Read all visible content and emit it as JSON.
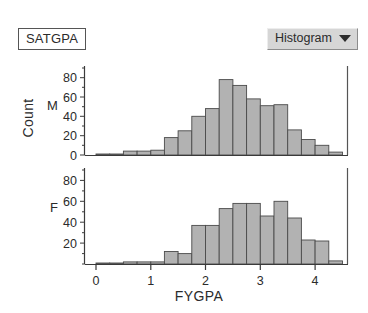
{
  "header": {
    "variable_label": "SATGPA",
    "menu_label": "Histogram",
    "menu_icon": "chevron-down-icon"
  },
  "axes": {
    "y_title": "Count",
    "x_title": "FYGPA",
    "x_ticks": [
      "0",
      "1",
      "2",
      "3",
      "4"
    ],
    "y_ticks_top": [
      "0",
      "20",
      "40",
      "60",
      "80"
    ],
    "y_ticks_bottom": [
      "20",
      "40",
      "60",
      "80"
    ],
    "group_top": "M",
    "group_bottom": "F"
  },
  "chart_data": {
    "type": "bar",
    "title": "SATGPA",
    "subtitle": "Histogram",
    "xlabel": "FYGPA",
    "ylabel": "Count",
    "xlim": [
      -0.2,
      4.6
    ],
    "ylim": [
      0,
      90
    ],
    "grid": false,
    "legend": "none",
    "bin_width": 0.25,
    "orientation": "stacked-panels",
    "panels": [
      {
        "name": "M",
        "label": "M",
        "ylim": [
          0,
          90
        ],
        "yticks": [
          0,
          20,
          40,
          60,
          80
        ],
        "bins": [
          {
            "x0": 0.0,
            "x1": 0.25,
            "value": 1
          },
          {
            "x0": 0.25,
            "x1": 0.5,
            "value": 1
          },
          {
            "x0": 0.5,
            "x1": 0.75,
            "value": 4
          },
          {
            "x0": 0.75,
            "x1": 1.0,
            "value": 4
          },
          {
            "x0": 1.0,
            "x1": 1.25,
            "value": 5
          },
          {
            "x0": 1.25,
            "x1": 1.5,
            "value": 18
          },
          {
            "x0": 1.5,
            "x1": 1.75,
            "value": 25
          },
          {
            "x0": 1.75,
            "x1": 2.0,
            "value": 40
          },
          {
            "x0": 2.0,
            "x1": 2.25,
            "value": 48
          },
          {
            "x0": 2.25,
            "x1": 2.5,
            "value": 78
          },
          {
            "x0": 2.5,
            "x1": 2.75,
            "value": 72
          },
          {
            "x0": 2.75,
            "x1": 3.0,
            "value": 58
          },
          {
            "x0": 3.0,
            "x1": 3.25,
            "value": 51
          },
          {
            "x0": 3.25,
            "x1": 3.5,
            "value": 52
          },
          {
            "x0": 3.5,
            "x1": 3.75,
            "value": 26
          },
          {
            "x0": 3.75,
            "x1": 4.0,
            "value": 16
          },
          {
            "x0": 4.0,
            "x1": 4.25,
            "value": 10
          },
          {
            "x0": 4.25,
            "x1": 4.5,
            "value": 3
          }
        ]
      },
      {
        "name": "F",
        "label": "F",
        "ylim": [
          0,
          90
        ],
        "yticks": [
          20,
          40,
          60,
          80
        ],
        "bins": [
          {
            "x0": 0.0,
            "x1": 0.25,
            "value": 1
          },
          {
            "x0": 0.25,
            "x1": 0.5,
            "value": 1
          },
          {
            "x0": 0.5,
            "x1": 0.75,
            "value": 2
          },
          {
            "x0": 0.75,
            "x1": 1.0,
            "value": 2
          },
          {
            "x0": 1.0,
            "x1": 1.25,
            "value": 2
          },
          {
            "x0": 1.25,
            "x1": 1.5,
            "value": 12
          },
          {
            "x0": 1.5,
            "x1": 1.75,
            "value": 10
          },
          {
            "x0": 1.75,
            "x1": 2.0,
            "value": 37
          },
          {
            "x0": 2.0,
            "x1": 2.25,
            "value": 37
          },
          {
            "x0": 2.25,
            "x1": 2.5,
            "value": 53
          },
          {
            "x0": 2.5,
            "x1": 2.75,
            "value": 58
          },
          {
            "x0": 2.75,
            "x1": 3.0,
            "value": 58
          },
          {
            "x0": 3.0,
            "x1": 3.25,
            "value": 46
          },
          {
            "x0": 3.25,
            "x1": 3.5,
            "value": 60
          },
          {
            "x0": 3.5,
            "x1": 3.75,
            "value": 44
          },
          {
            "x0": 3.75,
            "x1": 4.0,
            "value": 23
          },
          {
            "x0": 4.0,
            "x1": 4.25,
            "value": 22
          },
          {
            "x0": 4.25,
            "x1": 4.5,
            "value": 3
          }
        ]
      }
    ],
    "colors": {
      "bar_fill": "#b2b2b2",
      "bar_stroke": "#4a4a4a",
      "axis": "#3a3a3a",
      "menu_bg": "#d6d6d6"
    }
  }
}
